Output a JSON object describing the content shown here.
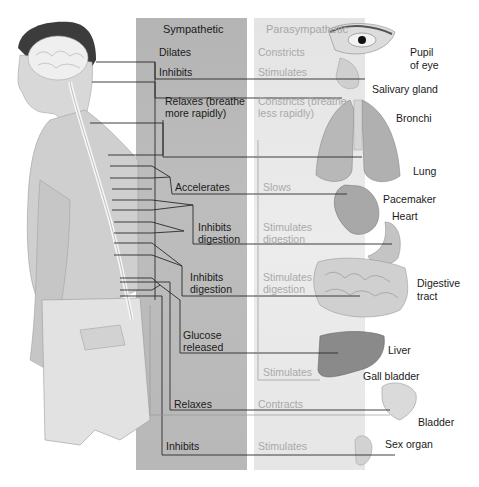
{
  "columns": {
    "sympathetic": "Sympathetic",
    "parasympathetic": "Parasympathetic"
  },
  "rows": [
    {
      "sympathetic": "Dilates",
      "parasympathetic": "Constricts",
      "organ": "Pupil\nof eye"
    },
    {
      "sympathetic": "Inhibits",
      "parasympathetic": "Stimulates",
      "organ": "Salivary gland"
    },
    {
      "sympathetic": "Relaxes (breathe\nmore rapidly)",
      "parasympathetic": "Constricts (breathe\nless rapidly)",
      "organ": "Bronchi"
    },
    {
      "sympathetic": "",
      "parasympathetic": "",
      "organ": "Lung"
    },
    {
      "sympathetic": "Accelerates",
      "parasympathetic": "Slows",
      "organ": "Pacemaker"
    },
    {
      "sympathetic": "",
      "parasympathetic": "",
      "organ": "Heart"
    },
    {
      "sympathetic": "Inhibits\ndigestion",
      "parasympathetic": "Stimulates\ndigestion",
      "organ": ""
    },
    {
      "sympathetic": "Inhibits\ndigestion",
      "parasympathetic": "Stimulates\ndigestion",
      "organ": "Digestive\ntract"
    },
    {
      "sympathetic": "Glucose\nreleased",
      "parasympathetic": "",
      "organ": "Liver"
    },
    {
      "sympathetic": "",
      "parasympathetic": "Stimulates",
      "organ": "Gall bladder"
    },
    {
      "sympathetic": "Relaxes",
      "parasympathetic": "Contracts",
      "organ": "Bladder"
    },
    {
      "sympathetic": "Inhibits",
      "parasympathetic": "Stimulates",
      "organ": "Sex organ"
    }
  ],
  "colors": {
    "sympathetic_bg": "#b8b8b8",
    "parasympathetic_bg": "#e8e8e8",
    "parasympathetic_text": "#a9a9a9",
    "line": "#333333"
  }
}
